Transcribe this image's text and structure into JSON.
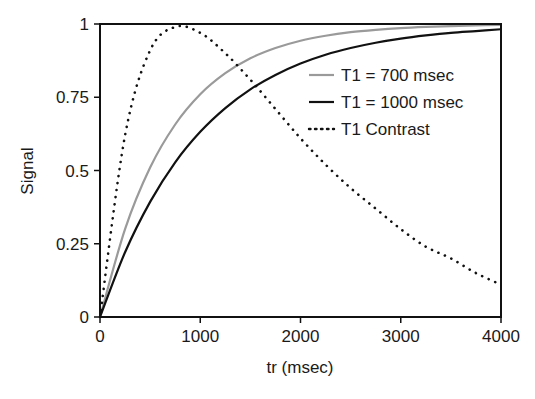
{
  "chart_data": {
    "type": "line",
    "title": "",
    "xlabel": "tr (msec)",
    "ylabel": "Signal",
    "xlim": [
      0,
      4000
    ],
    "ylim": [
      0,
      1
    ],
    "xticks": [
      0,
      1000,
      2000,
      3000,
      4000
    ],
    "xtick_labels": [
      "0",
      "1000",
      "2000",
      "3000",
      "4000"
    ],
    "yticks": [
      0,
      0.25,
      0.5,
      0.75,
      1
    ],
    "ytick_labels": [
      "0",
      "0.25",
      "0.5",
      "0.75",
      "1"
    ],
    "grid": false,
    "legend_position": "upper right (inside)",
    "x": [
      0,
      250,
      500,
      750,
      1000,
      1250,
      1500,
      1750,
      2000,
      2250,
      2500,
      2750,
      3000,
      3250,
      3500,
      3750,
      4000
    ],
    "series": [
      {
        "name": "T1 = 700 msec",
        "style": "solid",
        "color": "#9a9a9a",
        "values": [
          0,
          0.3,
          0.51,
          0.657,
          0.76,
          0.832,
          0.883,
          0.918,
          0.943,
          0.96,
          0.972,
          0.98,
          0.986,
          0.99,
          0.993,
          0.995,
          0.997
        ]
      },
      {
        "name": "T1 = 1000 msec",
        "style": "solid",
        "color": "#111111",
        "values": [
          0,
          0.221,
          0.393,
          0.528,
          0.632,
          0.713,
          0.777,
          0.826,
          0.865,
          0.895,
          0.918,
          0.936,
          0.95,
          0.961,
          0.97,
          0.976,
          0.982
        ]
      },
      {
        "name": "T1 Contrast",
        "style": "dotted",
        "color": "#111111",
        "values": [
          0,
          0.62,
          0.91,
          0.99,
          0.97,
          0.9,
          0.81,
          0.71,
          0.61,
          0.52,
          0.44,
          0.37,
          0.3,
          0.24,
          0.2,
          0.15,
          0.11
        ]
      }
    ]
  },
  "legend": {
    "items": [
      {
        "label": "T1 = 700 msec",
        "style": "solid",
        "color": "#9a9a9a"
      },
      {
        "label": "T1 = 1000 msec",
        "style": "solid",
        "color": "#111111"
      },
      {
        "label": "T1 Contrast",
        "style": "dotted",
        "color": "#111111"
      }
    ]
  },
  "colors": {
    "axis": "#111111",
    "gray_curve": "#9a9a9a",
    "black_curve": "#111111",
    "background": "#ffffff"
  }
}
